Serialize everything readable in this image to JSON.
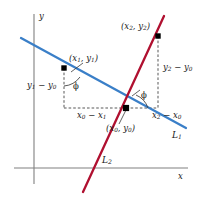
{
  "figure": {
    "background": "#ffffff",
    "width": 202,
    "height": 198
  },
  "colors": {
    "line1": "#3a7fc8",
    "line2": "#b01030",
    "axis": "#808080",
    "dash": "#3a3a3a",
    "text": "#1a1a1a",
    "point": "#000000"
  },
  "axes": {
    "x_label": "x",
    "y_label": "y"
  },
  "lines": [
    {
      "id": "L1",
      "label": "L",
      "subscript": "1",
      "color": "#3a7fc8",
      "description": "blue line with negative slope"
    },
    {
      "id": "L2",
      "label": "L",
      "subscript": "2",
      "color": "#b01030",
      "description": "red line with steep positive slope"
    }
  ],
  "points": [
    {
      "id": "p1",
      "label": "(x1, y1)",
      "open": "(",
      "x_text": "x",
      "x_sub": "1",
      "comma": ", ",
      "y_text": "y",
      "y_sub": "1",
      "close": ")",
      "on_line": "L1"
    },
    {
      "id": "p2",
      "label": "(x2, y2)",
      "open": "(",
      "x_text": "x",
      "x_sub": "2",
      "comma": ", ",
      "y_text": "y",
      "y_sub": "2",
      "close": ")",
      "on_line": "L2"
    },
    {
      "id": "p0",
      "label": "(x0, y0)",
      "open": "(",
      "x_text": "x",
      "x_sub": "0",
      "comma": ", ",
      "y_text": "y",
      "y_sub": "0",
      "close": ")",
      "on_line": "intersection"
    }
  ],
  "segments": [
    {
      "id": "dy1",
      "a_text": "y",
      "a_sub": "1",
      "op": " − ",
      "b_text": "y",
      "b_sub": "0",
      "orientation": "vertical",
      "side": "left"
    },
    {
      "id": "dx1",
      "a_text": "x",
      "a_sub": "0",
      "op": " − ",
      "b_text": "x",
      "b_sub": "1",
      "orientation": "horizontal",
      "side": "left"
    },
    {
      "id": "dy2",
      "a_text": "y",
      "a_sub": "2",
      "op": " − ",
      "b_text": "y",
      "b_sub": "0",
      "orientation": "vertical",
      "side": "right"
    },
    {
      "id": "dx2",
      "a_text": "x",
      "a_sub": "2",
      "op": " − ",
      "b_text": "x",
      "b_sub": "0",
      "orientation": "horizontal",
      "side": "right"
    }
  ],
  "angles": [
    {
      "id": "phi-left",
      "label": "ϕ",
      "at": "point-1"
    },
    {
      "id": "phi-right",
      "label": "ϕ",
      "at": "point-0"
    }
  ]
}
